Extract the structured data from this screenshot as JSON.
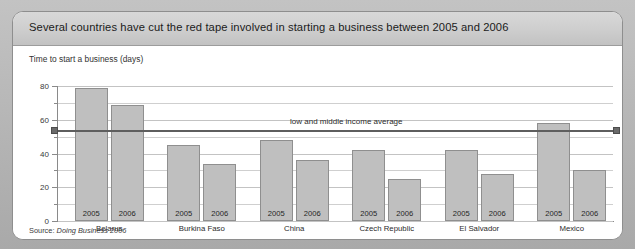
{
  "header": {
    "title": "Several countries have cut the red tape involved in starting a business between 2005 and 2006"
  },
  "source": {
    "label": "Source:",
    "text": "Doing Business 2006"
  },
  "chart_data": {
    "type": "bar",
    "title": "Several countries have cut the red tape involved in starting a business between 2005 and 2006",
    "subtitle": "Time to start a business (days)",
    "xlabel": "",
    "ylabel": "Time to start a business (days)",
    "ylim": [
      0,
      80
    ],
    "yticks": [
      0,
      20,
      40,
      60,
      80
    ],
    "ytick_labels": [
      "0",
      "20",
      "40",
      "60",
      "80"
    ],
    "minor_gridlines": [
      10,
      30,
      50,
      70
    ],
    "grid": true,
    "legend": "none",
    "categories": [
      "Belarus",
      "Burkina Faso",
      "China",
      "Czech Republic",
      "El Salvador",
      "Mexico"
    ],
    "series": [
      {
        "name": "2005",
        "values": [
          79,
          45,
          48,
          42,
          42,
          58
        ]
      },
      {
        "name": "2006",
        "values": [
          69,
          34,
          36,
          25,
          28,
          30
        ]
      }
    ],
    "reference_line": {
      "label": "low and middle income average",
      "value": 54,
      "color": "#5e5e5e"
    },
    "colors": {
      "bar_fill": "#bfbfbf",
      "bar_stroke": "#8f8f8f",
      "gridline": "#cfcfcf",
      "axis": "#8a8a8a",
      "title_band": "#cfcfcf"
    }
  }
}
